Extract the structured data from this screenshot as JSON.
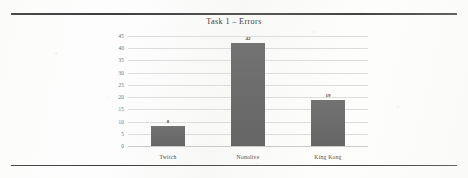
{
  "chart_data": {
    "type": "bar",
    "title": "Task 1 – Errors",
    "categories": [
      "Twitch",
      "Nonolive",
      "King Kong"
    ],
    "values": [
      8,
      42,
      19
    ],
    "value_labels": [
      "8",
      "42",
      "19"
    ],
    "xlabel": "",
    "ylabel": "",
    "ylim": [
      0,
      45
    ],
    "ytick_labels": [
      "45",
      "40",
      "35",
      "30",
      "25",
      "20",
      "15",
      "10",
      "5",
      "0"
    ],
    "ytick_values": [
      45,
      40,
      35,
      30,
      25,
      20,
      15,
      10,
      5,
      0
    ],
    "grid": true,
    "legend": "none",
    "bar_color": "#6b6b6b",
    "gridline_color": "#dcdcdc"
  }
}
